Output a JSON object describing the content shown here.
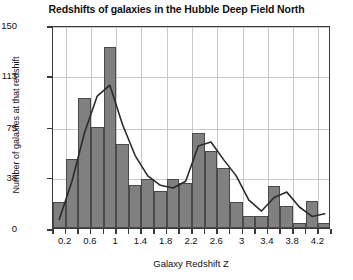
{
  "chart_data": {
    "type": "bar",
    "title": "Redshifts of galaxies in the Hubble Deep Field North",
    "xlabel": "Galaxy Redshift Z",
    "ylabel": "Number of galaxies at that redshift",
    "xlim": [
      0.0,
      4.4
    ],
    "ylim": [
      0,
      150
    ],
    "grid": true,
    "legend": "none",
    "bin_width": 0.2,
    "x_tick_labels": [
      "0.2",
      "0.6",
      "1",
      "1.4",
      "1.8",
      "2.2",
      "2.6",
      "3",
      "3.4",
      "3.8",
      "4.2"
    ],
    "x_tick_values": [
      0.2,
      0.6,
      1.0,
      1.4,
      1.8,
      2.2,
      2.6,
      3.0,
      3.4,
      3.8,
      4.2
    ],
    "y_tick_labels": [
      "0",
      "38",
      "75",
      "113",
      "150"
    ],
    "y_tick_values": [
      0,
      38,
      75,
      113,
      150
    ],
    "bin_starts": [
      0.0,
      0.2,
      0.4,
      0.6,
      0.8,
      1.0,
      1.2,
      1.4,
      1.6,
      1.8,
      2.0,
      2.2,
      2.4,
      2.6,
      2.8,
      3.0,
      3.2,
      3.4,
      3.6,
      3.8,
      4.0,
      4.2
    ],
    "bin_centers": [
      0.1,
      0.3,
      0.5,
      0.7,
      0.9,
      1.1,
      1.3,
      1.5,
      1.7,
      1.9,
      2.1,
      2.3,
      2.5,
      2.7,
      2.9,
      3.1,
      3.3,
      3.5,
      3.7,
      3.9,
      4.1,
      4.3
    ],
    "values": [
      19,
      51,
      96,
      75,
      134,
      62,
      32,
      36,
      27,
      36,
      33,
      70,
      57,
      44,
      19,
      9,
      9,
      31,
      16,
      4,
      20,
      4
    ],
    "series": [
      {
        "name": "Number of galaxies at that redshift",
        "values": [
          19,
          51,
          96,
          75,
          134,
          62,
          32,
          36,
          27,
          36,
          33,
          70,
          57,
          44,
          19,
          9,
          9,
          31,
          16,
          4,
          20,
          4
        ]
      },
      {
        "name": "smoothed trend",
        "type": "line",
        "x": [
          0.1,
          0.3,
          0.5,
          0.7,
          0.9,
          1.1,
          1.3,
          1.5,
          1.7,
          1.9,
          2.1,
          2.3,
          2.5,
          2.7,
          2.9,
          3.1,
          3.3,
          3.5,
          3.7,
          3.9,
          4.1,
          4.3
        ],
        "values": [
          8,
          36,
          72,
          99,
          107,
          78,
          55,
          40,
          33,
          31,
          36,
          62,
          65,
          52,
          40,
          22,
          14,
          24,
          28,
          17,
          10,
          12
        ]
      }
    ]
  },
  "style": {
    "bar_fill": "#808080",
    "bar_stroke": "#4a4a4a",
    "line_color": "#2b2b2b",
    "grid_color": "#c9c9c9",
    "axis_color": "#3a3a3a",
    "background": "#ffffff"
  }
}
